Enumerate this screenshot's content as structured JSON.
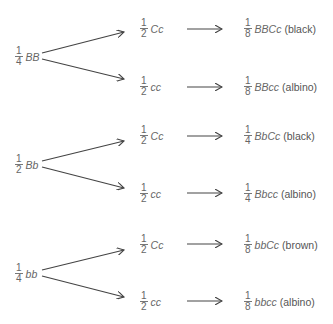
{
  "diagram": {
    "type": "probability-tree",
    "groups": [
      {
        "root": {
          "fraction_num": "1",
          "fraction_den": "4",
          "genotype": "BB"
        },
        "branches": [
          {
            "fraction_num": "1",
            "fraction_den": "2",
            "genotype": "Cc",
            "result": {
              "fraction_num": "1",
              "fraction_den": "8",
              "genotype": "BBCc",
              "phenotype": "(black)"
            }
          },
          {
            "fraction_num": "1",
            "fraction_den": "2",
            "genotype": "cc",
            "result": {
              "fraction_num": "1",
              "fraction_den": "8",
              "genotype": "BBcc",
              "phenotype": "(albino)"
            }
          }
        ]
      },
      {
        "root": {
          "fraction_num": "1",
          "fraction_den": "2",
          "genotype": "Bb"
        },
        "branches": [
          {
            "fraction_num": "1",
            "fraction_den": "2",
            "genotype": "Cc",
            "result": {
              "fraction_num": "1",
              "fraction_den": "4",
              "genotype": "BbCc",
              "phenotype": "(black)"
            }
          },
          {
            "fraction_num": "1",
            "fraction_den": "2",
            "genotype": "cc",
            "result": {
              "fraction_num": "1",
              "fraction_den": "4",
              "genotype": "Bbcc",
              "phenotype": "(albino)"
            }
          }
        ]
      },
      {
        "root": {
          "fraction_num": "1",
          "fraction_den": "4",
          "genotype": "bb"
        },
        "branches": [
          {
            "fraction_num": "1",
            "fraction_den": "2",
            "genotype": "Cc",
            "result": {
              "fraction_num": "1",
              "fraction_den": "8",
              "genotype": "bbCc",
              "phenotype": "(brown)"
            }
          },
          {
            "fraction_num": "1",
            "fraction_den": "2",
            "genotype": "cc",
            "result": {
              "fraction_num": "1",
              "fraction_den": "8",
              "genotype": "bbcc",
              "phenotype": "(albino)"
            }
          }
        ]
      }
    ]
  }
}
